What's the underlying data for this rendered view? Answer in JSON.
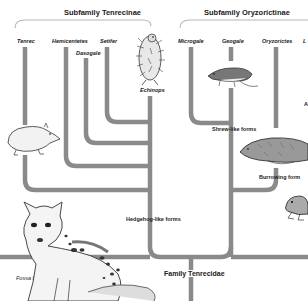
{
  "header": {
    "subfamily_left": "Subfamily Tenrecinae",
    "subfamily_right": "Subfamily Oryzorictinae"
  },
  "genera": {
    "tenrec": "Tenrec",
    "hemicentetes": "Hemicentetes",
    "dasogale": "Dasogale",
    "setifer": "Setifer",
    "echinops": "Echinops",
    "microgale": "Microgale",
    "geogale": "Geogale",
    "oryzorictes": "Oryzorictes",
    "cutoff_right": "L",
    "cutoff_right_lower": "A"
  },
  "forms": {
    "shrew_like": "Shrew-like forms",
    "burrowing": "Burrowing form",
    "hedgehog_like": "Hedgehog-like forms"
  },
  "family": "Family Tenrecidae",
  "outgroup": "Fossa fossa",
  "colors": {
    "branch": "#8a8a8a",
    "bracket": "#b5b5b5",
    "text": "#1a1a1a"
  }
}
